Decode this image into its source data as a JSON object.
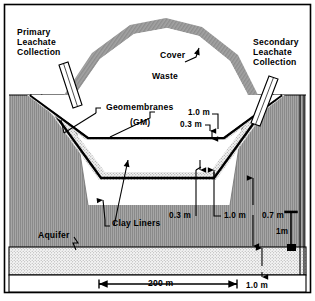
{
  "figure": {
    "type": "engineering-cross-section"
  },
  "labels": {
    "primary_leachate_line1": "Primary",
    "primary_leachate_line2": "Leachate",
    "primary_leachate_line3": "Collection",
    "secondary_leachate_line1": "Secondary",
    "secondary_leachate_line2": "Leachate",
    "secondary_leachate_line3": "Collection",
    "cover": "Cover",
    "waste": "Waste",
    "geomembranes": "Geomembranes",
    "geomembranes_abbrev": "(GM)",
    "clay_liners": "Clay Liners",
    "aquifer": "Aquifer"
  },
  "dimensions": {
    "upper_1_0m": "1.0 m",
    "upper_0_3m": "0.3 m",
    "lower_0_3m": "0.3 m",
    "lower_1_0m": "1.0 m",
    "unsaturated_0_7m": "0.7 m",
    "scale_vertical": "1m",
    "width_200m": "200 m",
    "aquifer_1_0m": "1.0 m"
  },
  "colors": {
    "ink": "#000000",
    "soil_fill": "#8f8f8f",
    "cover_fill": "#9a9a9a",
    "sand_fill": "#e8e8e8",
    "aquifer_fill": "#ededed",
    "background": "#ffffff"
  }
}
